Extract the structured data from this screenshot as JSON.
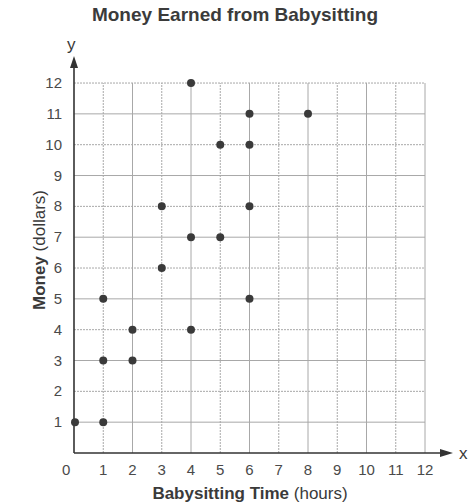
{
  "chart_data": {
    "type": "scatter",
    "title": "Money Earned from Babysitting",
    "xlabel": "Babysitting Time",
    "xlabel_unit": "(hours)",
    "ylabel": "Money",
    "ylabel_unit": "(dollars)",
    "x_axis_letter": "x",
    "y_axis_letter": "y",
    "origin_label": "0",
    "xlim": [
      0,
      12
    ],
    "ylim": [
      0,
      12
    ],
    "x_ticks": [
      1,
      2,
      3,
      4,
      5,
      6,
      7,
      8,
      9,
      10,
      11,
      12
    ],
    "y_ticks": [
      1,
      2,
      3,
      4,
      5,
      6,
      7,
      8,
      9,
      10,
      11,
      12
    ],
    "grid": true,
    "legend": null,
    "points": [
      {
        "x": 0,
        "y": 1
      },
      {
        "x": 1,
        "y": 1
      },
      {
        "x": 1,
        "y": 3
      },
      {
        "x": 1,
        "y": 5
      },
      {
        "x": 2,
        "y": 3
      },
      {
        "x": 2,
        "y": 4
      },
      {
        "x": 3,
        "y": 6
      },
      {
        "x": 3,
        "y": 8
      },
      {
        "x": 4,
        "y": 4
      },
      {
        "x": 4,
        "y": 7
      },
      {
        "x": 4,
        "y": 12
      },
      {
        "x": 5,
        "y": 7
      },
      {
        "x": 5,
        "y": 10
      },
      {
        "x": 6,
        "y": 5
      },
      {
        "x": 6,
        "y": 8
      },
      {
        "x": 6,
        "y": 10
      },
      {
        "x": 6,
        "y": 11
      },
      {
        "x": 8,
        "y": 11
      }
    ]
  },
  "colors": {
    "point": "#3a3a3a",
    "axis": "#333333",
    "grid": "#a8a8a8"
  }
}
